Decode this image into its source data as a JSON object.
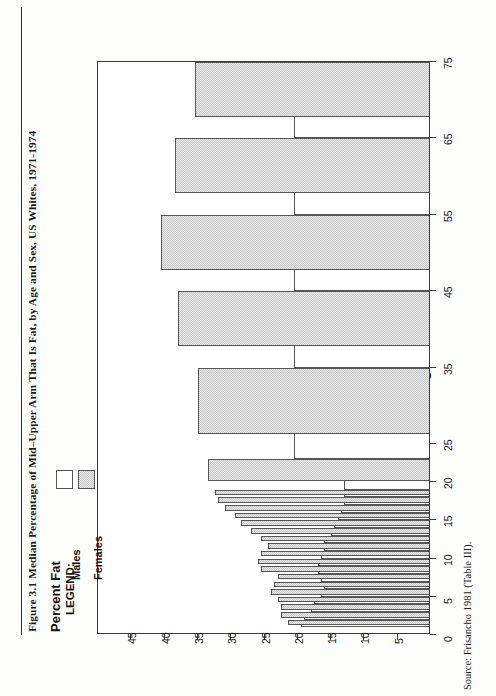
{
  "figure": {
    "title": "Figure 3.1  Median Percentage of Mid–Upper Arm That Is Fat, by Age and Sex, US Whites, 1971-1974",
    "source": "Source:  Frisancho 1981 (Table III)."
  },
  "legend": {
    "title": "LEGEND:",
    "entries": [
      {
        "label": "Males",
        "swatch": "white-box-swatch"
      },
      {
        "label": "Females",
        "swatch": "shaded-box-swatch"
      }
    ]
  },
  "chart_data": {
    "type": "bar",
    "orientation": "horizontal-rotated",
    "title": "Figure 3.1  Median Percentage of Mid–Upper Arm That Is Fat, by Age and Sex, US Whites, 1971-1974",
    "xlabel": "Age",
    "ylabel": "Percent Fat",
    "xlim": [
      0,
      75
    ],
    "ylim": [
      0,
      50
    ],
    "grid": false,
    "legend_position": "lower-left",
    "x_tick_labels": [
      "0",
      "5",
      "10",
      "15",
      "20",
      "25",
      "35",
      "45",
      "55",
      "65",
      "75"
    ],
    "x_tick_values": [
      0,
      5,
      10,
      15,
      20,
      25,
      35,
      45,
      55,
      65,
      75
    ],
    "y_tick_labels": [
      "5",
      "10",
      "15",
      "20",
      "25",
      "30",
      "35",
      "40",
      "45"
    ],
    "y_tick_values": [
      5,
      10,
      15,
      20,
      25,
      30,
      35,
      40,
      45
    ],
    "categories": [
      "1",
      "2",
      "3",
      "4",
      "5",
      "6",
      "7",
      "8",
      "9",
      "10",
      "11",
      "12",
      "13",
      "14",
      "15",
      "16",
      "17",
      "18",
      "19-22",
      "23-34",
      "35-44",
      "45-54",
      "55-64",
      "65-74"
    ],
    "category_bands": [
      {
        "label": "1",
        "start": 1,
        "end": 2
      },
      {
        "label": "2",
        "start": 2,
        "end": 3
      },
      {
        "label": "3",
        "start": 3,
        "end": 4
      },
      {
        "label": "4",
        "start": 4,
        "end": 5
      },
      {
        "label": "5",
        "start": 5,
        "end": 6
      },
      {
        "label": "6",
        "start": 6,
        "end": 7
      },
      {
        "label": "7",
        "start": 7,
        "end": 8
      },
      {
        "label": "8",
        "start": 8,
        "end": 9
      },
      {
        "label": "9",
        "start": 9,
        "end": 10
      },
      {
        "label": "10",
        "start": 10,
        "end": 11
      },
      {
        "label": "11",
        "start": 11,
        "end": 12
      },
      {
        "label": "12",
        "start": 12,
        "end": 13
      },
      {
        "label": "13",
        "start": 13,
        "end": 14
      },
      {
        "label": "14",
        "start": 14,
        "end": 15
      },
      {
        "label": "15",
        "start": 15,
        "end": 16
      },
      {
        "label": "16",
        "start": 16,
        "end": 17
      },
      {
        "label": "17",
        "start": 17,
        "end": 18
      },
      {
        "label": "18",
        "start": 18,
        "end": 19
      },
      {
        "label": "19-22",
        "start": 19,
        "end": 23
      },
      {
        "label": "23-34",
        "start": 23,
        "end": 35
      },
      {
        "label": "35-44",
        "start": 35,
        "end": 45
      },
      {
        "label": "45-54",
        "start": 45,
        "end": 55
      },
      {
        "label": "55-64",
        "start": 55,
        "end": 65
      },
      {
        "label": "65-74",
        "start": 65,
        "end": 75
      }
    ],
    "series": [
      {
        "name": "Males",
        "swatch": "white",
        "values": [
          19.5,
          19.0,
          18.0,
          17.5,
          16.5,
          16.0,
          16.5,
          17.0,
          17.0,
          16.5,
          16.0,
          16.0,
          15.0,
          14.5,
          14.0,
          13.5,
          13.0,
          13.0,
          13.0,
          20.5,
          20.5,
          20.5,
          20.5,
          20.5
        ]
      },
      {
        "name": "Females",
        "swatch": "shaded",
        "values": [
          21.5,
          22.5,
          22.5,
          23.0,
          24.0,
          23.5,
          23.0,
          25.5,
          26.0,
          25.5,
          24.5,
          25.5,
          27.0,
          28.5,
          29.5,
          31.0,
          32.0,
          32.5,
          33.5,
          35.0,
          38.0,
          40.5,
          38.5,
          35.5
        ]
      }
    ]
  }
}
